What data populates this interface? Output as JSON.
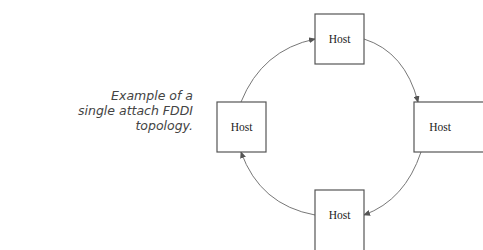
{
  "caption": {
    "line1": "Example of a",
    "line2": "single attach FDDI",
    "line3": "topology."
  },
  "diagram": {
    "nodes": [
      {
        "id": "top",
        "label": "Host"
      },
      {
        "id": "right",
        "label": "Host"
      },
      {
        "id": "bottom",
        "label": "Host"
      },
      {
        "id": "left",
        "label": "Host"
      }
    ],
    "ring_direction": "clockwise",
    "edges": [
      {
        "from": "top",
        "to": "right"
      },
      {
        "from": "right",
        "to": "bottom"
      },
      {
        "from": "bottom",
        "to": "left"
      },
      {
        "from": "left",
        "to": "top"
      }
    ]
  }
}
